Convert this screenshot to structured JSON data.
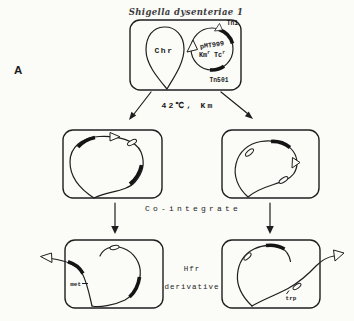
{
  "panel_label": "A",
  "title": "Shigella dysenteriae 1",
  "top_cell": {
    "chromosome_label": "Chr",
    "plasmid_name": "pMT999",
    "marker_km": "Km",
    "marker_km_sup": "r",
    "marker_tc": " Tc",
    "marker_tc_sup": "r",
    "tn1_label": "Tn1",
    "tn501_label": "Tn501"
  },
  "step": {
    "condition_label": "42℃, Km"
  },
  "middle": {
    "cointegrate_label": "Co-integrate"
  },
  "bottom": {
    "hfr_line1": "Hfr",
    "hfr_line2": "derivative",
    "left_gene_label": "met",
    "right_gene_label": "trp"
  },
  "colors": {
    "ink": "#1f1f1f",
    "background": "#fbfbf8"
  }
}
